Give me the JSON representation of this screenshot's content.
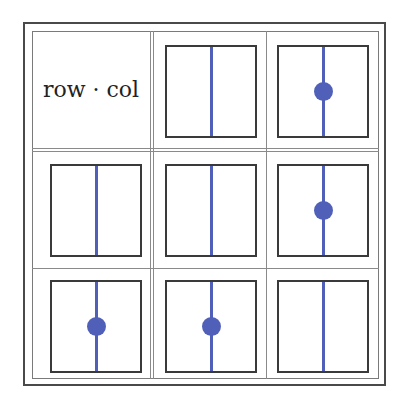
{
  "header_label": "row · col",
  "colors": {
    "stem": "#5060b8",
    "dot": "#5060b8",
    "box_border": "#3a3a3a"
  },
  "grid": {
    "rows": 3,
    "cols": 3,
    "cells": [
      {
        "row": 0,
        "col": 0,
        "type": "label"
      },
      {
        "row": 0,
        "col": 1,
        "type": "box",
        "dot": false
      },
      {
        "row": 0,
        "col": 2,
        "type": "box",
        "dot": true
      },
      {
        "row": 1,
        "col": 0,
        "type": "box",
        "dot": false
      },
      {
        "row": 1,
        "col": 1,
        "type": "box",
        "dot": false
      },
      {
        "row": 1,
        "col": 2,
        "type": "box",
        "dot": true
      },
      {
        "row": 2,
        "col": 0,
        "type": "box",
        "dot": true
      },
      {
        "row": 2,
        "col": 1,
        "type": "box",
        "dot": true
      },
      {
        "row": 2,
        "col": 2,
        "type": "box",
        "dot": false
      }
    ]
  }
}
